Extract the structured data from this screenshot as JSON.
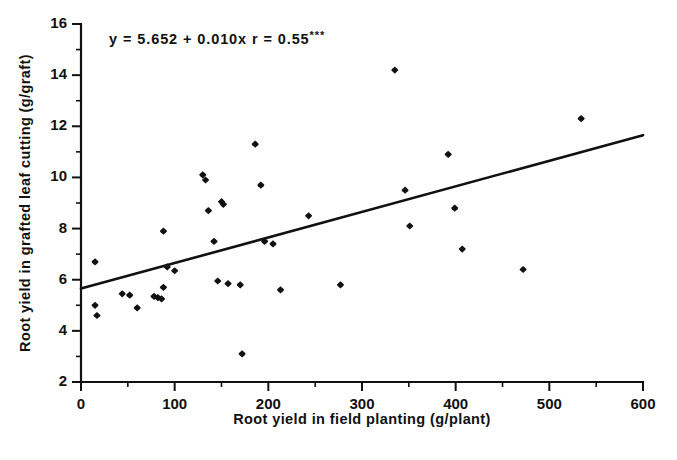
{
  "chart_data": {
    "type": "scatter",
    "title": "",
    "xlabel": "Root yield in field planting (g/plant)",
    "ylabel": "Root yield in grafted leaf cutting (g/graft)",
    "xlim": [
      0,
      600
    ],
    "ylim": [
      2,
      16
    ],
    "xticks": [
      0,
      100,
      200,
      300,
      400,
      500,
      600
    ],
    "yticks": [
      2,
      4,
      6,
      8,
      10,
      12,
      14,
      16
    ],
    "xtick_labels": [
      "0",
      "100",
      "200",
      "300",
      "400",
      "500",
      "600"
    ],
    "ytick_labels": [
      "2",
      "4",
      "6",
      "8",
      "10",
      "12",
      "14",
      "16"
    ],
    "x_minor_interval": 50,
    "y_minor_interval": 1,
    "grid": false,
    "legend": false,
    "marker": "filled-diamond",
    "marker_color": "#111111",
    "annotations": [
      {
        "text": "y = 5.652 + 0.010x    r = 0.55***",
        "equation": "y = 5.652 + 0.010x",
        "correlation": "r = 0.55",
        "significance": "***",
        "x": 30,
        "y": 15.2
      }
    ],
    "fit_line": {
      "type": "linear",
      "intercept": 5.652,
      "slope": 0.01,
      "r": 0.55,
      "significance": "***",
      "x_start": 0,
      "x_end": 600,
      "y_start": 5.652,
      "y_end": 11.652
    },
    "points": [
      {
        "x": 15,
        "y": 6.7
      },
      {
        "x": 15,
        "y": 5.0
      },
      {
        "x": 17,
        "y": 4.6
      },
      {
        "x": 44,
        "y": 5.45
      },
      {
        "x": 52,
        "y": 5.4
      },
      {
        "x": 60,
        "y": 4.9
      },
      {
        "x": 78,
        "y": 5.35
      },
      {
        "x": 82,
        "y": 5.3
      },
      {
        "x": 86,
        "y": 5.25
      },
      {
        "x": 88,
        "y": 5.7
      },
      {
        "x": 88,
        "y": 7.9
      },
      {
        "x": 92,
        "y": 6.5
      },
      {
        "x": 100,
        "y": 6.35
      },
      {
        "x": 130,
        "y": 10.1
      },
      {
        "x": 133,
        "y": 9.9
      },
      {
        "x": 136,
        "y": 8.7
      },
      {
        "x": 142,
        "y": 7.5
      },
      {
        "x": 146,
        "y": 5.95
      },
      {
        "x": 150,
        "y": 9.05
      },
      {
        "x": 152,
        "y": 8.95
      },
      {
        "x": 157,
        "y": 5.85
      },
      {
        "x": 170,
        "y": 5.8
      },
      {
        "x": 172,
        "y": 3.1
      },
      {
        "x": 186,
        "y": 11.3
      },
      {
        "x": 192,
        "y": 9.7
      },
      {
        "x": 196,
        "y": 7.5
      },
      {
        "x": 205,
        "y": 7.4
      },
      {
        "x": 213,
        "y": 5.6
      },
      {
        "x": 243,
        "y": 8.5
      },
      {
        "x": 277,
        "y": 5.8
      },
      {
        "x": 335,
        "y": 14.2
      },
      {
        "x": 346,
        "y": 9.5
      },
      {
        "x": 351,
        "y": 8.1
      },
      {
        "x": 392,
        "y": 10.9
      },
      {
        "x": 399,
        "y": 8.8
      },
      {
        "x": 407,
        "y": 7.2
      },
      {
        "x": 472,
        "y": 6.4
      },
      {
        "x": 534,
        "y": 12.3
      }
    ]
  }
}
